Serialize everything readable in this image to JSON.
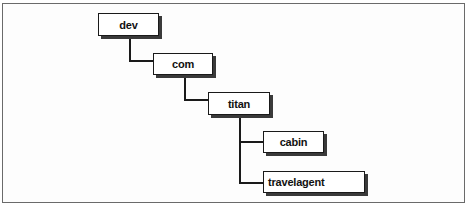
{
  "diagram": {
    "type": "tree",
    "nodes": [
      {
        "id": "dev",
        "label": "dev",
        "parent": null
      },
      {
        "id": "com",
        "label": "com",
        "parent": "dev"
      },
      {
        "id": "titan",
        "label": "titan",
        "parent": "com"
      },
      {
        "id": "cabin",
        "label": "cabin",
        "parent": "titan"
      },
      {
        "id": "travelagent",
        "label": "travelagent",
        "parent": "titan"
      }
    ],
    "colors": {
      "box_border": "#1a1a1a",
      "box_shadow": "#3a3a3a",
      "box_fill": "#ffffff",
      "frame_border": "#6a6a6a",
      "text": "#111111"
    }
  }
}
